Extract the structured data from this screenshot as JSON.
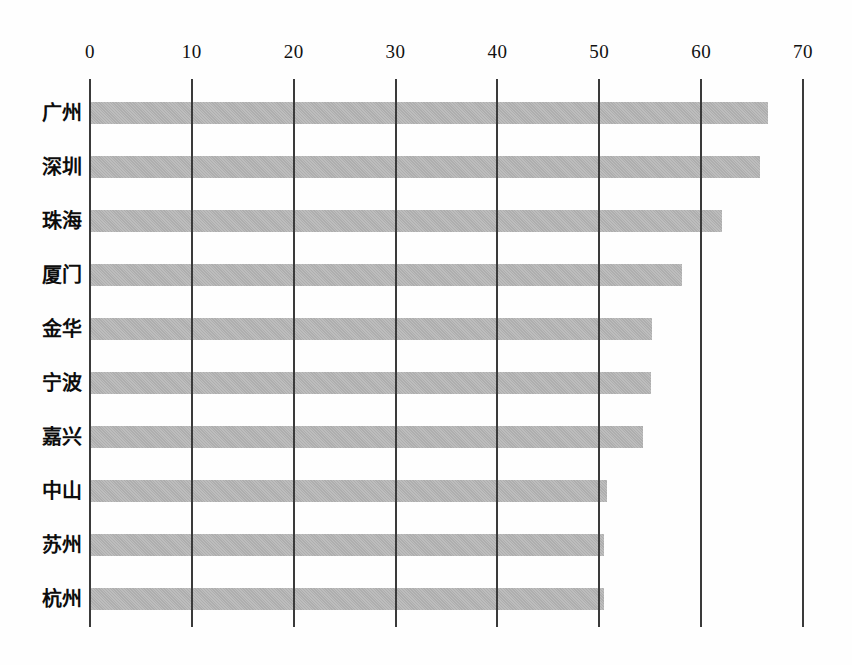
{
  "chart_data": {
    "type": "bar",
    "orientation": "horizontal",
    "title": "",
    "subtitle": "",
    "xlabel": "",
    "ylabel": "",
    "categories": [
      "广州",
      "深圳",
      "珠海",
      "厦门",
      "金华",
      "宁波",
      "嘉兴",
      "中山",
      "苏州",
      "杭州"
    ],
    "values": [
      66.6,
      65.8,
      62.0,
      58.1,
      55.2,
      55.1,
      54.3,
      50.8,
      50.5,
      50.5
    ],
    "series": [
      {
        "name": "",
        "values": [
          66.6,
          65.8,
          62.0,
          58.1,
          55.2,
          55.1,
          54.3,
          50.8,
          50.5,
          50.5
        ]
      }
    ],
    "xlim": [
      0,
      70
    ],
    "xticks": [
      0,
      10,
      20,
      30,
      40,
      50,
      60,
      70
    ],
    "xtick_labels": [
      "0",
      "10",
      "20",
      "30",
      "40",
      "50",
      "60",
      "70"
    ],
    "grid": true,
    "grid_axis": "x",
    "legend": false,
    "legend_position": "none",
    "annotations": [],
    "bar_color": "#b6b6b6",
    "grid_color": "#3a3a3a",
    "background_color": "#ffffff",
    "text_color": "#111111"
  },
  "axis": {
    "ticks": [
      {
        "value": 0,
        "label": "0"
      },
      {
        "value": 10,
        "label": "10"
      },
      {
        "value": 20,
        "label": "20"
      },
      {
        "value": 30,
        "label": "30"
      },
      {
        "value": 40,
        "label": "40"
      },
      {
        "value": 50,
        "label": "50"
      },
      {
        "value": 60,
        "label": "60"
      },
      {
        "value": 70,
        "label": "70"
      }
    ]
  },
  "rows": [
    {
      "label": "广州",
      "value": 66.6
    },
    {
      "label": "深圳",
      "value": 65.8
    },
    {
      "label": "珠海",
      "value": 62.0
    },
    {
      "label": "厦门",
      "value": 58.1
    },
    {
      "label": "金华",
      "value": 55.2
    },
    {
      "label": "宁波",
      "value": 55.1
    },
    {
      "label": "嘉兴",
      "value": 54.3
    },
    {
      "label": "中山",
      "value": 50.8
    },
    {
      "label": "苏州",
      "value": 50.5
    },
    {
      "label": "杭州",
      "value": 50.5
    }
  ]
}
